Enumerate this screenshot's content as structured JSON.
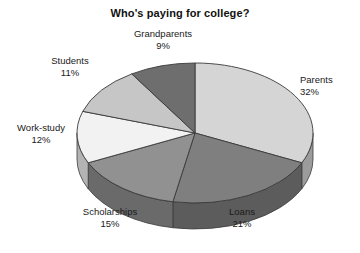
{
  "chart_data": {
    "type": "pie",
    "title": "Who's paying for college?",
    "xlabel": "",
    "ylabel": "",
    "categories": [
      "Parents",
      "Loans",
      "Scholarships",
      "Work-study",
      "Students",
      "Grandparents"
    ],
    "values": [
      32,
      21,
      15,
      12,
      11,
      9
    ],
    "unit": "%",
    "legend": "none",
    "grid": false,
    "three_d": true,
    "slices": [
      {
        "label": "Parents",
        "value": 32,
        "value_text": "32%",
        "color": "#d5d5d5",
        "side_color": "#9c9c9c"
      },
      {
        "label": "Loans",
        "value": 21,
        "value_text": "21%",
        "color": "#7f7f7f",
        "side_color": "#5c5c5c"
      },
      {
        "label": "Scholarships",
        "value": 15,
        "value_text": "15%",
        "color": "#919191",
        "side_color": "#6a6a6a"
      },
      {
        "label": "Work-study",
        "value": 12,
        "value_text": "12%",
        "color": "#f2f2f2",
        "side_color": "#b4b4b4"
      },
      {
        "label": "Students",
        "value": 11,
        "value_text": "11%",
        "color": "#c6c6c6",
        "side_color": "#909090"
      },
      {
        "label": "Grandparents",
        "value": 9,
        "value_text": "9%",
        "color": "#6e6e6e",
        "side_color": "#505050"
      }
    ],
    "labels": {
      "grandparents": {
        "name": "Grandparents",
        "pct": "9%"
      },
      "parents": {
        "name": "Parents",
        "pct": "32%"
      },
      "students": {
        "name": "Students",
        "pct": "11%"
      },
      "workstudy": {
        "name": "Work-study",
        "pct": "12%"
      },
      "scholarships": {
        "name": "Scholarships",
        "pct": "15%"
      },
      "loans": {
        "name": "Loans",
        "pct": "21%"
      }
    },
    "colors": {
      "background": "#ffffff",
      "outline": "#3a3a3a",
      "text": "#1a1a1a"
    }
  }
}
